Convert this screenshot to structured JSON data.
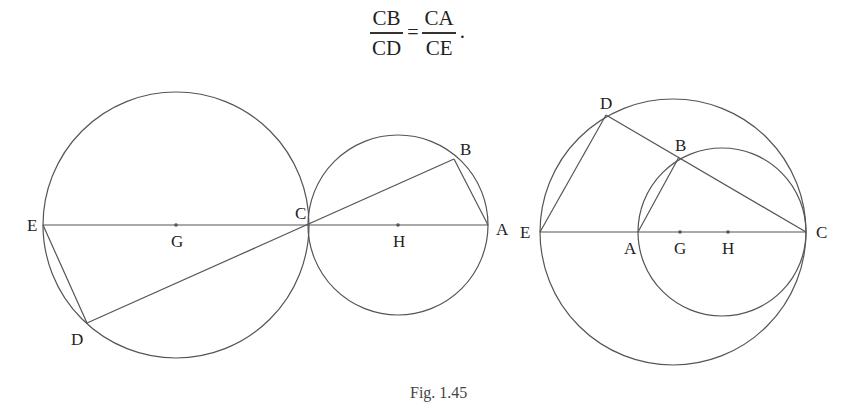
{
  "formula": {
    "lhs": {
      "numerator": "CB",
      "denominator": "CD"
    },
    "equals": "=",
    "rhs": {
      "numerator": "CA",
      "denominator": "CE"
    },
    "terminator": "."
  },
  "figures": [
    {
      "id": "left",
      "circles": [
        {
          "center": "G",
          "cx": 176,
          "cy": 225,
          "r": 133
        },
        {
          "center": "H",
          "cx": 398,
          "cy": 225,
          "r": 90
        }
      ],
      "points": {
        "E": {
          "label": "E",
          "x": 43,
          "y": 225
        },
        "G": {
          "label": "G",
          "x": 176,
          "y": 225
        },
        "C": {
          "label": "C",
          "x": 309,
          "y": 225
        },
        "H": {
          "label": "H",
          "x": 398,
          "y": 225
        },
        "A": {
          "label": "A",
          "x": 488,
          "y": 225
        },
        "B": {
          "label": "B",
          "x": 454,
          "y": 159
        },
        "D": {
          "label": "D",
          "x": 87,
          "y": 323
        }
      },
      "segments": [
        "E-A",
        "B-D",
        "B-A",
        "E-D"
      ]
    },
    {
      "id": "right",
      "circles": [
        {
          "center": "G",
          "cx": 673,
          "cy": 232,
          "r": 133
        },
        {
          "center": "H",
          "cx": 722,
          "cy": 232,
          "r": 84
        }
      ],
      "points": {
        "E": {
          "label": "E",
          "x": 540,
          "y": 232
        },
        "A": {
          "label": "A",
          "x": 638,
          "y": 232
        },
        "G": {
          "label": "G",
          "x": 680,
          "y": 232
        },
        "H": {
          "label": "H",
          "x": 728,
          "y": 232
        },
        "C": {
          "label": "C",
          "x": 806,
          "y": 232
        },
        "D": {
          "label": "D",
          "x": 606,
          "y": 115
        },
        "B": {
          "label": "B",
          "x": 679,
          "y": 157
        }
      },
      "segments": [
        "E-C",
        "D-C",
        "E-D",
        "A-B"
      ]
    }
  ],
  "caption": "Fig. 1.45"
}
